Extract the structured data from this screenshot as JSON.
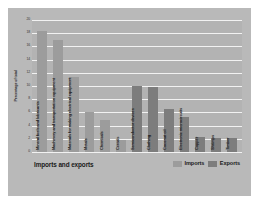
{
  "chart_data": {
    "type": "bar",
    "title": "Imports and exports",
    "xlabel": "",
    "ylabel": "Percentage of total",
    "ylim": [
      0,
      20
    ],
    "ytick_step": 2,
    "yticks": [
      0,
      2,
      4,
      6,
      8,
      10,
      12,
      14,
      16,
      18,
      20
    ],
    "grid": true,
    "legend_position": "bottom-right",
    "categories": [
      "Mineral fuels and lubricants",
      "Machinery and transportation equipment",
      "Materials for making electrical equipment",
      "Metals",
      "Chemicals",
      "Cereals",
      "Semiconductor devices",
      "Clothing",
      "Coconut oil",
      "Electronic microcircuits",
      "Copper",
      "Shrimps",
      "Timber"
    ],
    "series": [
      {
        "name": "Imports",
        "color": "#9c9c9c",
        "points": [
          {
            "category": "Mineral fuels and lubricants",
            "value": 18.3
          },
          {
            "category": "Machinery and transportation equipment",
            "value": 16.9
          },
          {
            "category": "Materials for making electrical equipment",
            "value": 11.4
          },
          {
            "category": "Metals",
            "value": 6.0
          },
          {
            "category": "Chemicals",
            "value": 4.8
          },
          {
            "category": "Cereals",
            "value": 1.8
          }
        ]
      },
      {
        "name": "Exports",
        "color": "#7d7d7d",
        "points": [
          {
            "category": "Semiconductor devices",
            "value": 10.0
          },
          {
            "category": "Clothing",
            "value": 9.8
          },
          {
            "category": "Coconut oil",
            "value": 6.5
          },
          {
            "category": "Electronic microcircuits",
            "value": 5.3
          },
          {
            "category": "Copper",
            "value": 2.2
          },
          {
            "category": "Shrimps",
            "value": 2.1
          },
          {
            "category": "Timber",
            "value": 2.1
          }
        ]
      }
    ],
    "bars": [
      {
        "label": "Mineral fuels and lubricants",
        "value": 18.3,
        "series": "Imports"
      },
      {
        "label": "Machinery and transportation equipment",
        "value": 16.9,
        "series": "Imports"
      },
      {
        "label": "Materials for making electrical equipment",
        "value": 11.4,
        "series": "Imports"
      },
      {
        "label": "Metals",
        "value": 6.0,
        "series": "Imports"
      },
      {
        "label": "Chemicals",
        "value": 4.8,
        "series": "Imports"
      },
      {
        "label": "Cereals",
        "value": 1.8,
        "series": "Imports"
      },
      {
        "label": "Semiconductor devices",
        "value": 10.0,
        "series": "Exports"
      },
      {
        "label": "Clothing",
        "value": 9.8,
        "series": "Exports"
      },
      {
        "label": "Coconut oil",
        "value": 6.5,
        "series": "Exports"
      },
      {
        "label": "Electronic microcircuits",
        "value": 5.3,
        "series": "Exports"
      },
      {
        "label": "Copper",
        "value": 2.2,
        "series": "Exports"
      },
      {
        "label": "Shrimps",
        "value": 2.1,
        "series": "Exports"
      },
      {
        "label": "Timber",
        "value": 2.1,
        "series": "Exports"
      }
    ]
  },
  "legend": {
    "items": [
      {
        "label": "Imports",
        "color": "#9c9c9c"
      },
      {
        "label": "Exports",
        "color": "#7d7d7d"
      }
    ]
  },
  "colors": {
    "imports": "#9c9c9c",
    "exports": "#7d7d7d",
    "figure_background": "#b9b9b9",
    "plot_background": "#b3b3b3",
    "gridline": "#f2f2f2"
  }
}
